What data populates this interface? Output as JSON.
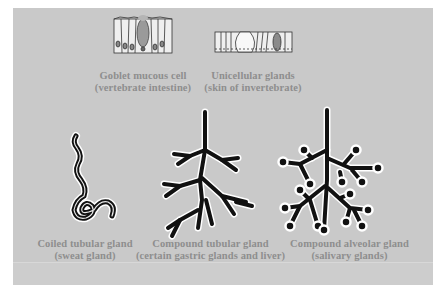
{
  "figure": {
    "background_color": "#c9c9c9",
    "label_color": "#8e8e8e"
  },
  "glands": [
    {
      "id": "goblet",
      "title": "Goblet mucous cell",
      "subtitle": "(vertebrate intestine)"
    },
    {
      "id": "unicellular",
      "title": "Unicellular glands",
      "subtitle": "(skin of invertebrate)"
    },
    {
      "id": "coiled",
      "title": "Coiled tubular gland",
      "subtitle": "(sweat gland)"
    },
    {
      "id": "compound-tubular",
      "title": "Compound tubular gland",
      "subtitle": "(certain gastric glands and liver)"
    },
    {
      "id": "compound-alveolar",
      "title": "Compound alveolar gland",
      "subtitle": "(salivary glands)"
    }
  ]
}
